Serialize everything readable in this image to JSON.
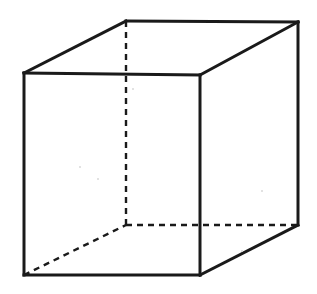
{
  "figure": {
    "canvas": {
      "width": 317,
      "height": 294
    },
    "background_color": "#ffffff",
    "line_color": "#1a1a1a",
    "visible_edge_width": 3,
    "hidden_edge_width": 2.4,
    "hidden_dash_pattern": "6 5"
  },
  "geometry": {
    "vertices": {
      "front_top_left": {
        "label": "front-top-left",
        "x": 24,
        "y": 73
      },
      "front_top_right": {
        "label": "front-top-right",
        "x": 200,
        "y": 75
      },
      "front_bottom_right": {
        "label": "front-bottom-right",
        "x": 200,
        "y": 275
      },
      "front_bottom_left": {
        "label": "front-bottom-left",
        "x": 24,
        "y": 275
      },
      "back_top_left": {
        "label": "back-top-left",
        "x": 126,
        "y": 21
      },
      "back_top_right": {
        "label": "back-top-right",
        "x": 298,
        "y": 22
      },
      "back_bottom_right": {
        "label": "back-bottom-right",
        "x": 298,
        "y": 225
      },
      "back_bottom_left": {
        "label": "back-bottom-left",
        "x": 126,
        "y": 225
      }
    },
    "front_face_path": "M 24 73 L 200 75 L 200 275 L 24 275 Z",
    "visible_edges": [
      {
        "name": "front-top",
        "d": "M 24 73 L 200 75"
      },
      {
        "name": "front-right",
        "d": "M 200 75 L 200 275"
      },
      {
        "name": "front-bottom",
        "d": "M 200 275 L 24 275"
      },
      {
        "name": "front-left",
        "d": "M 24 275 L 24 73"
      },
      {
        "name": "top-left-receding",
        "d": "M 24 73 L 126 21"
      },
      {
        "name": "top-right-receding",
        "d": "M 200 75 L 298 22"
      },
      {
        "name": "back-top",
        "d": "M 126 21 L 298 22"
      },
      {
        "name": "back-right-vertical",
        "d": "M 298 22 L 298 225"
      },
      {
        "name": "bottom-right-receding",
        "d": "M 200 275 L 298 225"
      }
    ],
    "hidden_edges": [
      {
        "name": "back-left-vertical",
        "d": "M 126 21 L 126 225"
      },
      {
        "name": "back-bottom",
        "d": "M 126 225 L 298 225"
      },
      {
        "name": "bottom-left-receding",
        "d": "M 24 275 L 126 225"
      }
    ]
  },
  "artifacts": {
    "specks": [
      {
        "x": 79,
        "y": 166,
        "size": 2
      },
      {
        "x": 97,
        "y": 178,
        "size": 2
      },
      {
        "x": 132,
        "y": 88,
        "size": 2
      },
      {
        "x": 261,
        "y": 190,
        "size": 2
      },
      {
        "x": 241,
        "y": 250,
        "size": 2
      }
    ]
  }
}
